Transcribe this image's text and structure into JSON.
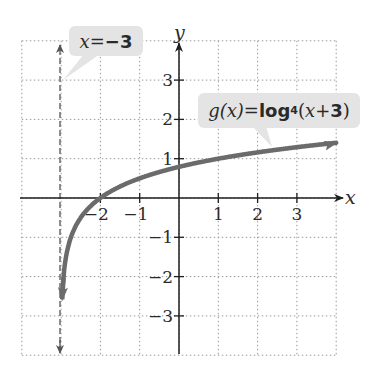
{
  "chart_data": {
    "type": "line",
    "title": "",
    "xlabel": "x",
    "ylabel": "y",
    "xlim": [
      -4,
      4
    ],
    "ylim": [
      -4,
      4
    ],
    "grid": true,
    "x_ticks": [
      -2,
      -1,
      1,
      2,
      3
    ],
    "y_ticks": [
      3,
      2,
      1,
      -1,
      -2,
      -3
    ],
    "x_tick_labels": [
      "−2",
      "−1",
      "1",
      "2",
      "3"
    ],
    "y_tick_labels": [
      "3",
      "2",
      "1",
      "−1",
      "−2",
      "−3"
    ],
    "series": [
      {
        "name": "g(x) = log4 (x + 3)",
        "function": "log4(x + 3)",
        "x": [
          -2.97,
          -2.9,
          -2.75,
          -2.5,
          -2,
          -1,
          0,
          1,
          2,
          3,
          4
        ],
        "values": [
          -3.32,
          -1.66,
          -1.0,
          -0.5,
          0,
          0.5,
          0.79,
          1,
          1.16,
          1.29,
          1.4
        ],
        "color": "#6b6b6b"
      }
    ],
    "asymptote": {
      "name": "x = −3",
      "x": -3,
      "style": "dashed"
    },
    "annotations": [
      {
        "text": "x = −3",
        "target": "vertical asymptote"
      },
      {
        "text": "g(x) = log4 (x + 3)",
        "target": "curve"
      }
    ],
    "marked_points": [
      {
        "x": -2,
        "y": 0
      }
    ]
  },
  "labels": {
    "asymptote": {
      "var": "x",
      "eq": " = ",
      "val": "−3"
    },
    "function": {
      "lhs": "g(x)",
      "eq": " = ",
      "log": "log",
      "base": "4",
      "arg_open": " (",
      "arg_var": "x",
      "arg_rest": " + ",
      "arg_num": "3",
      "arg_close": ")"
    }
  },
  "axes": {
    "x_name": "x",
    "y_name": "y"
  },
  "colors": {
    "curve": "#6b6b6b",
    "axis": "#1e1e1e",
    "grid": "#9a9a9a",
    "label_bg": "#e4e4e4"
  }
}
